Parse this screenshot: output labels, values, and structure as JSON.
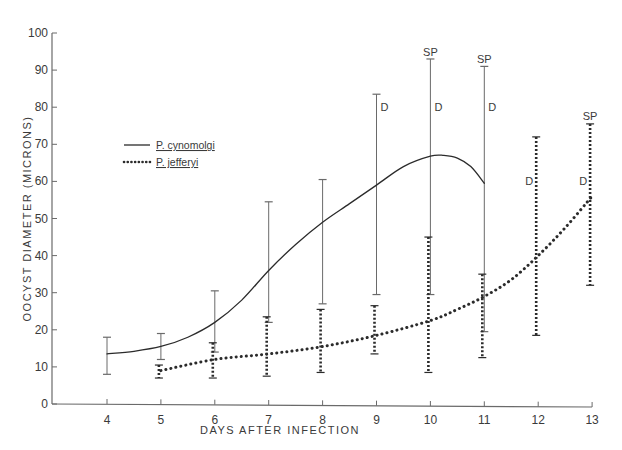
{
  "chart_data": {
    "type": "line",
    "title": "",
    "xlabel": "DAYS AFTER INFECTION",
    "ylabel": "OOCYST DIAMETER (MICRONS)",
    "xlim": [
      3,
      13
    ],
    "ylim": [
      0,
      100
    ],
    "x_ticks": [
      4,
      5,
      6,
      7,
      8,
      9,
      10,
      11,
      12,
      13
    ],
    "y_ticks": [
      0,
      10,
      20,
      30,
      40,
      50,
      60,
      70,
      80,
      90,
      100
    ],
    "grid": false,
    "legend_position": "upper-left",
    "error_bars": true,
    "annotation_key": {
      "D": "D",
      "SP": "SP"
    },
    "series": [
      {
        "name": "P. cynomolgi",
        "legend_prefix": "P.",
        "legend_species": "cynomolgi",
        "line_style": "solid",
        "x": [
          4,
          5,
          6,
          7,
          8,
          9,
          10,
          11
        ],
        "values": [
          13.5,
          15.5,
          22,
          36,
          49,
          59,
          67,
          59.5
        ],
        "curve_x": [
          4,
          4.5,
          5,
          5.5,
          6,
          6.5,
          7,
          7.5,
          8,
          8.5,
          9,
          9.5,
          10,
          10.25,
          10.5,
          10.75,
          11
        ],
        "curve_y": [
          13.5,
          14.2,
          15.5,
          18,
          22,
          28,
          36,
          43,
          49,
          54,
          59,
          64,
          66.8,
          67,
          66.3,
          64,
          59.5
        ],
        "error_low": [
          8,
          12,
          14,
          22,
          27,
          29.5,
          29.5,
          19.5
        ],
        "error_high": [
          18,
          19,
          30.5,
          54.5,
          60.5,
          83.5,
          93,
          91
        ],
        "annotations": [
          {
            "x": 9,
            "y": 80,
            "label": "D"
          },
          {
            "x": 10,
            "y": 80,
            "label": "D"
          },
          {
            "x": 10,
            "y": 95,
            "label": "SP",
            "at_top": true
          },
          {
            "x": 11,
            "y": 80,
            "label": "D"
          },
          {
            "x": 11,
            "y": 93,
            "label": "SP",
            "at_top": true
          }
        ]
      },
      {
        "name": "P. jefferyi",
        "legend_prefix": "P.",
        "legend_species": "jefferyi",
        "line_style": "dotted",
        "x": [
          5,
          6,
          7,
          8,
          9,
          10,
          11,
          12,
          13
        ],
        "values": [
          9,
          12.5,
          13.5,
          15.5,
          19,
          22.5,
          29,
          40,
          56
        ],
        "curve_x": [
          5,
          6,
          7,
          8,
          9,
          10,
          10.5,
          11,
          11.5,
          12,
          12.5,
          13
        ],
        "curve_y": [
          9,
          12,
          13.5,
          15.5,
          18.5,
          22.5,
          25.5,
          29,
          33.5,
          40,
          47.5,
          56
        ],
        "error_low": [
          7,
          7,
          7.5,
          8.5,
          13.5,
          8.5,
          12.5,
          18.5,
          32
        ],
        "error_high": [
          10.5,
          16.5,
          23.5,
          25.5,
          26.5,
          45,
          35,
          72,
          75.5
        ],
        "annotations": [
          {
            "x": 12,
            "y": 60,
            "label": "D",
            "side": "left"
          },
          {
            "x": 13,
            "y": 60,
            "label": "D",
            "side": "left"
          },
          {
            "x": 13,
            "y": 77.5,
            "label": "SP",
            "at_top": true
          }
        ]
      }
    ]
  },
  "colors": {
    "background": "#ffffff",
    "ink": "#2b2b2b",
    "light_ink": "#6a6a6a"
  }
}
